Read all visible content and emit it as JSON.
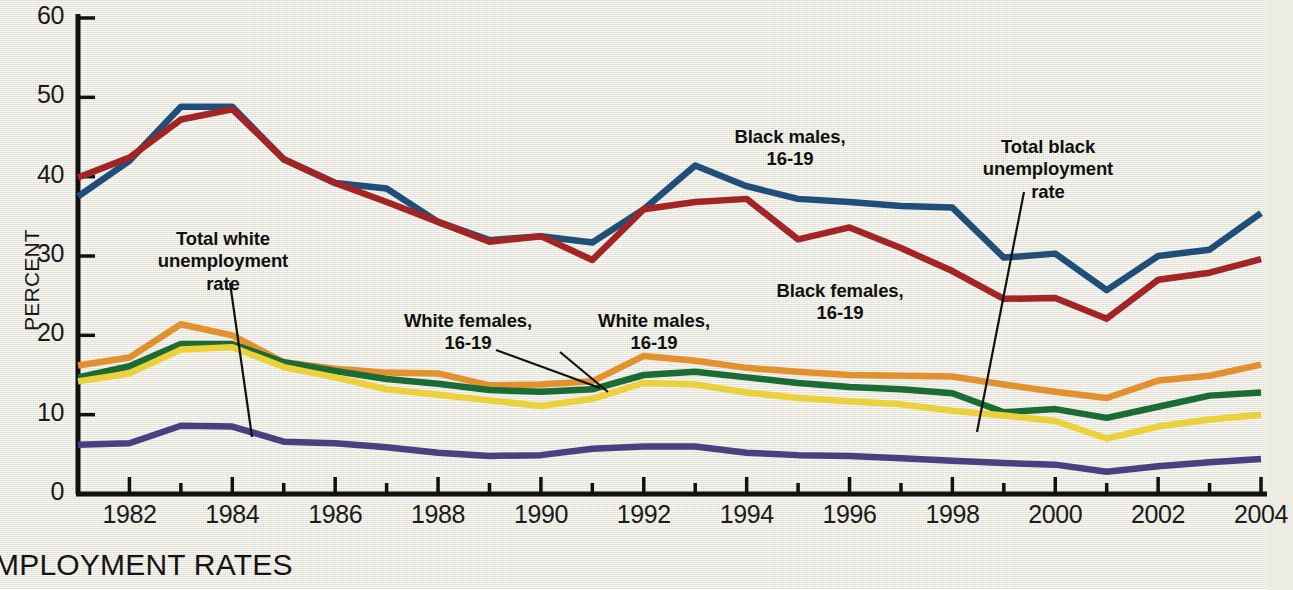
{
  "caption": "MPLOYMENT RATES",
  "chart_data": {
    "type": "line",
    "title": "",
    "xlabel": "",
    "ylabel": "PERCENT",
    "xlim": [
      1981,
      2004
    ],
    "ylim": [
      0,
      60
    ],
    "grid": false,
    "legend_position": "inline-annotations",
    "x": [
      1981,
      1982,
      1983,
      1984,
      1985,
      1986,
      1987,
      1988,
      1989,
      1990,
      1991,
      1992,
      1993,
      1994,
      1995,
      1996,
      1997,
      1998,
      1999,
      2000,
      2001,
      2002,
      2003,
      2004
    ],
    "x_tick_labels": [
      "1982",
      "1984",
      "1986",
      "1988",
      "1990",
      "1992",
      "1994",
      "1996",
      "1998",
      "2000",
      "2002",
      "2004"
    ],
    "y_tick_labels": [
      "0",
      "10",
      "20",
      "30",
      "40",
      "50",
      "60"
    ],
    "series": [
      {
        "name": "Black males, 16-19",
        "color": "#1f4e79",
        "values": [
          37.5,
          42.0,
          48.8,
          48.8,
          42.2,
          39.2,
          38.5,
          34.3,
          32.0,
          32.5,
          31.7,
          35.9,
          41.4,
          38.8,
          37.2,
          36.8,
          36.3,
          36.1,
          29.8,
          30.3,
          25.7,
          30.0,
          30.8,
          35.4
        ],
        "label_point": {
          "x": 1993,
          "y": 41.4
        }
      },
      {
        "name": "Black females, 16-19",
        "color": "#a32424",
        "values": [
          39.9,
          42.4,
          47.2,
          48.5,
          42.2,
          39.2,
          36.8,
          34.3,
          31.8,
          32.5,
          29.5,
          35.9,
          36.8,
          37.2,
          32.1,
          33.6,
          31.0,
          28.1,
          24.6,
          24.7,
          22.1,
          27.0,
          27.9,
          29.6
        ],
        "label_point": {
          "x": 1996,
          "y": 33.6
        }
      },
      {
        "name": "White females, 16-19",
        "color": "#e3912e",
        "values": [
          16.2,
          17.2,
          21.4,
          20.0,
          16.6,
          15.8,
          15.3,
          15.2,
          13.7,
          13.8,
          14.2,
          17.4,
          16.8,
          15.9,
          15.4,
          15.0,
          14.9,
          14.8,
          13.8,
          12.9,
          12.1,
          14.3,
          14.9,
          16.3
        ],
        "label_point": {
          "x": 1992,
          "y": 17.4
        }
      },
      {
        "name": "White males, 16-19",
        "color": "#1b6b35",
        "values": [
          14.7,
          16.1,
          18.9,
          18.9,
          16.6,
          15.5,
          14.5,
          13.9,
          13.1,
          12.9,
          13.2,
          15.0,
          15.4,
          14.7,
          14.0,
          13.5,
          13.2,
          12.7,
          10.3,
          10.7,
          9.6,
          11.0,
          12.4,
          12.8
        ],
        "label_point": {
          "x": 1993,
          "y": 15.4
        }
      },
      {
        "name": "Total black unemployment rate",
        "color": "#edd13b",
        "values": [
          14.2,
          15.2,
          18.2,
          18.5,
          16.0,
          14.7,
          13.2,
          12.5,
          11.8,
          11.1,
          12.0,
          14.0,
          13.8,
          12.8,
          12.1,
          11.7,
          11.3,
          10.5,
          9.9,
          9.2,
          7.0,
          8.5,
          9.4,
          10.0
        ],
        "label_point": {
          "x": 1999,
          "y": 9.9
        }
      },
      {
        "name": "Total white unemployment rate",
        "color": "#4a4080",
        "values": [
          6.2,
          6.4,
          8.6,
          8.5,
          6.6,
          6.4,
          5.9,
          5.2,
          4.8,
          4.9,
          5.7,
          6.0,
          6.0,
          5.2,
          4.9,
          4.8,
          4.5,
          4.2,
          3.9,
          3.7,
          2.8,
          3.5,
          4.0,
          4.4
        ],
        "label_point": {
          "x": 1984,
          "y": 8.5
        }
      }
    ],
    "annotations": [
      {
        "id": "total-white",
        "text": "Total white\nunemployment\nrate",
        "leader_from": [
          230,
          283
        ],
        "leader_to": [
          252,
          437
        ]
      },
      {
        "id": "white-females",
        "text": "White females,\n16-19",
        "leader_from": [
          496,
          350
        ],
        "leader_to": [
          600,
          388
        ]
      },
      {
        "id": "white-males",
        "text": "White males,\n16-19",
        "leader_from": [
          560,
          352
        ],
        "leader_to": [
          608,
          392
        ]
      },
      {
        "id": "black-males",
        "text": "Black males,\n16-19",
        "leader_from": [
          0,
          0
        ],
        "leader_to": [
          0,
          0
        ]
      },
      {
        "id": "black-females",
        "text": "Black females,\n16-19",
        "leader_from": [
          0,
          0
        ],
        "leader_to": [
          0,
          0
        ]
      },
      {
        "id": "total-black",
        "text": "Total black\nunemployment\nrate",
        "leader_from": [
          1024,
          192
        ],
        "leader_to": [
          977,
          432
        ]
      }
    ]
  }
}
